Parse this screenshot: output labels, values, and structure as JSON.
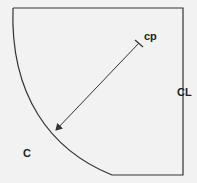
{
  "diagram": {
    "labels": {
      "center_point": "cp",
      "center_line": "CL",
      "circumference": "C"
    },
    "colors": {
      "background": "#f2f2f2",
      "stroke": "#333333",
      "text": "#222222"
    }
  }
}
